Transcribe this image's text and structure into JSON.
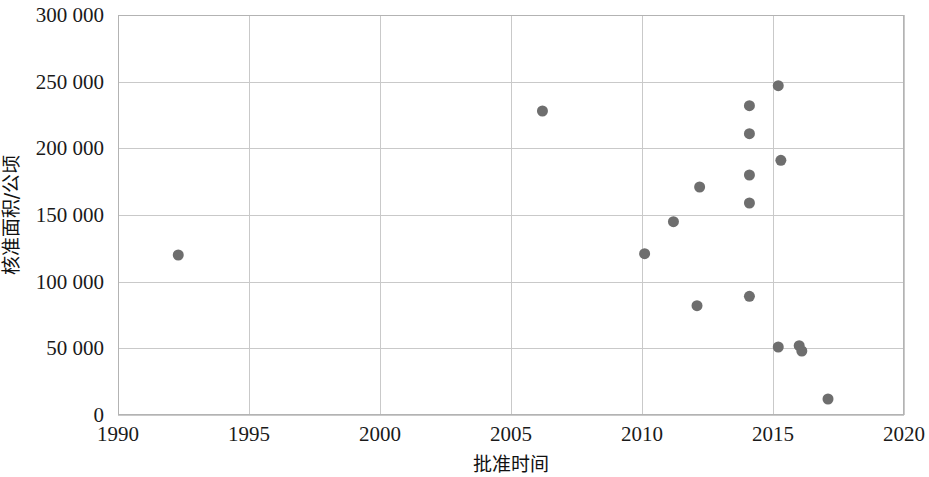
{
  "chart_data": {
    "type": "scatter",
    "title": "",
    "xlabel": "批准时间",
    "ylabel": "核准面积/公顷",
    "xlim": [
      1990,
      2020
    ],
    "ylim": [
      0,
      300000
    ],
    "xticks": [
      1990,
      1995,
      2000,
      2005,
      2010,
      2015,
      2020
    ],
    "xtick_labels": [
      "1990",
      "1995",
      "2000",
      "2005",
      "2010",
      "2015",
      "2020"
    ],
    "yticks": [
      0,
      50000,
      100000,
      150000,
      200000,
      250000,
      300000
    ],
    "ytick_labels": [
      "0",
      "50 000",
      "100 000",
      "150 000",
      "200 000",
      "250 000",
      "300 000"
    ],
    "grid": true,
    "grid_color": "#c9c9c9",
    "legend": null,
    "marker_color": "#6e6e6e",
    "marker_size": 11,
    "marker_shape": "circle",
    "series": [
      {
        "name": "核准面积",
        "points": [
          {
            "x": 1992.3,
            "y": 120000
          },
          {
            "x": 2006.2,
            "y": 228000
          },
          {
            "x": 2010.1,
            "y": 121000
          },
          {
            "x": 2011.2,
            "y": 145000
          },
          {
            "x": 2012.2,
            "y": 171000
          },
          {
            "x": 2012.1,
            "y": 82000
          },
          {
            "x": 2014.1,
            "y": 232000
          },
          {
            "x": 2014.1,
            "y": 211000
          },
          {
            "x": 2014.1,
            "y": 180000
          },
          {
            "x": 2014.1,
            "y": 159000
          },
          {
            "x": 2014.1,
            "y": 89000
          },
          {
            "x": 2015.2,
            "y": 247000
          },
          {
            "x": 2015.3,
            "y": 191000
          },
          {
            "x": 2015.2,
            "y": 51000
          },
          {
            "x": 2016.0,
            "y": 52000
          },
          {
            "x": 2016.1,
            "y": 48000
          },
          {
            "x": 2017.1,
            "y": 12000
          }
        ]
      }
    ]
  },
  "axes": {
    "plot_left_px": 118,
    "plot_right_px": 904,
    "plot_top_px": 15,
    "plot_bottom_px": 415
  }
}
